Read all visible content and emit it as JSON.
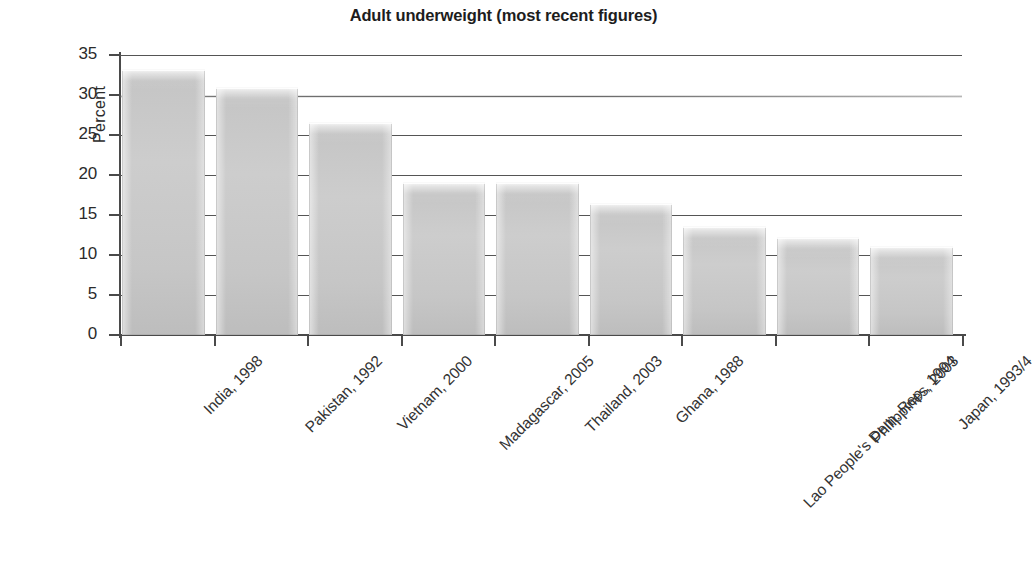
{
  "chart_data": {
    "type": "bar",
    "title": "Adult underweight (most recent figures)",
    "xlabel": "",
    "ylabel": "Percent",
    "ylim": [
      0,
      35
    ],
    "ytick_labels": [
      "0",
      "5",
      "10",
      "15",
      "20",
      "25",
      "30",
      "35"
    ],
    "yticks": [
      0,
      5,
      10,
      15,
      20,
      25,
      30,
      35
    ],
    "grid": true,
    "legend": false,
    "orientation": "vertical",
    "bar_color": "#c8c8c8",
    "categories": [
      "India, 1998",
      "Pakistan, 1992",
      "Vietnam, 2000",
      "Madagascar, 2005",
      "Thailand, 2003",
      "Ghana, 1988",
      "Lao People's Dem. Rep., 1994",
      "Philippines, 2003",
      "Japan, 1993/4"
    ],
    "values": [
      33.2,
      31.0,
      26.6,
      19.1,
      19.1,
      16.5,
      13.6,
      12.2,
      11.1
    ]
  }
}
